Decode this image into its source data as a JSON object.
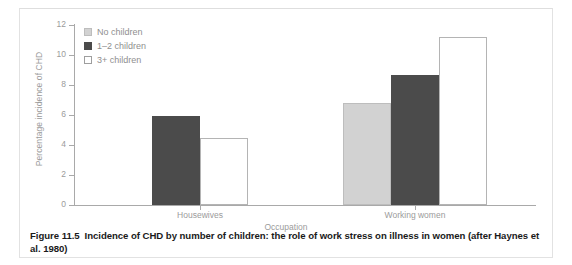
{
  "figure": {
    "caption_label": "Figure 11.5",
    "caption_text": "Incidence of CHD by number of children: the role of work stress on illness in women (after Haynes et al. 1980)"
  },
  "chart_data": {
    "type": "bar",
    "title": "",
    "xlabel": "Occupation",
    "ylabel": "Percentage incidence of CHD",
    "categories": [
      "Housewives",
      "Working women"
    ],
    "ylim": [
      0,
      12
    ],
    "yticks": [
      0,
      2,
      4,
      6,
      8,
      10,
      12
    ],
    "ytick_labels": [
      "0",
      "2",
      "4",
      "6",
      "8",
      "10",
      "12"
    ],
    "grid": false,
    "legend_position": "top-left",
    "series": [
      {
        "name": "No children",
        "color": "#d2d2d2",
        "values": [
          null,
          6.8
        ]
      },
      {
        "name": "1–2 children",
        "color": "#4b4b4b",
        "values": [
          5.95,
          8.7
        ]
      },
      {
        "name": "3+ children",
        "color": "#ffffff",
        "values": [
          4.5,
          11.2
        ]
      }
    ]
  },
  "axis_colors": {
    "axis_line": "#a9a9a9",
    "tick_text": "#9b9b9b",
    "caption_text": "#1a1a1a"
  }
}
